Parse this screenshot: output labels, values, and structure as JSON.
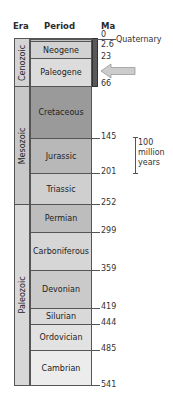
{
  "headers": {
    "era": "Era",
    "period": "Period",
    "ma": "Ma"
  },
  "eras": [
    {
      "name": "Cenozoic",
      "color": "#d4d4d4"
    },
    {
      "name": "Mesozoic",
      "color": "#c8c8c8"
    },
    {
      "name": "Paleozoic",
      "color": "#d8d8d8"
    }
  ],
  "periods": [
    {
      "name": "Neogene",
      "color": "#d2d2d2"
    },
    {
      "name": "Paleogene",
      "color": "#dcdcdc"
    },
    {
      "name": "Cretaceous",
      "color": "#9a9a9a"
    },
    {
      "name": "Jurassic",
      "color": "#b8b8b8"
    },
    {
      "name": "Triassic",
      "color": "#cfcfcf"
    },
    {
      "name": "Permian",
      "color": "#bdbdbd"
    },
    {
      "name": "Carboniferous",
      "color": "#d6d6d6"
    },
    {
      "name": "Devonian",
      "color": "#cacaca"
    },
    {
      "name": "Silurian",
      "color": "#d9d9d9"
    },
    {
      "name": "Ordovician",
      "color": "#e2e2e2"
    },
    {
      "name": "Cambrian",
      "color": "#ececec"
    }
  ],
  "ma_labels": [
    "0",
    "2.6",
    "23",
    "66",
    "145",
    "201",
    "252",
    "299",
    "359",
    "419",
    "444",
    "485",
    "541"
  ],
  "quaternary_label": "Quaternary",
  "scale_bar": {
    "line1": "100",
    "line2": "million",
    "line3": "years"
  },
  "arrow_color": "#c8c8c8"
}
